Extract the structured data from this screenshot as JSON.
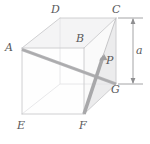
{
  "figure": {
    "background": "#ffffff",
    "edge_color": "#c9c9cb",
    "hidden_edge_color": "#dddddf",
    "face_color": "#f2f2f3",
    "shade_color": "#e6e6e7",
    "vector_color": "#a9a9ab",
    "vector_dark_color": "#9a9a9c",
    "label_color": "#58585a",
    "dimension_color": "#6e6e70"
  },
  "labels": {
    "A": "A",
    "B": "B",
    "C": "C",
    "D": "D",
    "E": "E",
    "F": "F",
    "G": "G",
    "P": "P",
    "a": "a"
  },
  "vertices": {
    "A": [
      22,
      48
    ],
    "B": [
      84,
      48
    ],
    "C": [
      116,
      18
    ],
    "D": [
      60,
      18
    ],
    "E": [
      22,
      114
    ],
    "F": [
      84,
      114
    ],
    "G": [
      116,
      84
    ],
    "H": [
      60,
      84
    ]
  },
  "elements": {
    "vector_ag_label": "vector-A-to-G",
    "vector_fc_label": "vector-F-to-P",
    "shaded_triangle_label": "triangle-C-F-G",
    "dimension_label": "height-dimension-a"
  }
}
